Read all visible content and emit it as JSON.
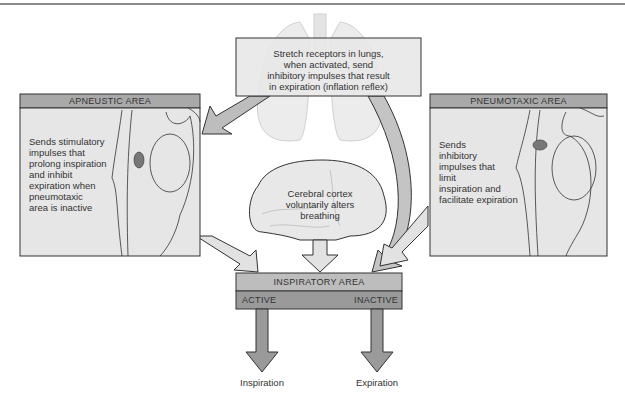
{
  "stretch_box": {
    "lines": [
      "Stretch receptors in lungs,",
      "when activated, send",
      "inhibitory impulses that result",
      "in expiration (inflation reflex)"
    ]
  },
  "apneustic": {
    "title": "APNEUSTIC AREA",
    "lines": [
      "Sends stimulatory",
      "impulses that",
      "prolong inspiration",
      "and inhibit",
      "expiration when",
      "pneumotaxic",
      "area is inactive"
    ]
  },
  "pneumotaxic": {
    "title": "PNEUMOTAXIC AREA",
    "lines": [
      "Sends",
      "inhibitory",
      "impulses that",
      "limit",
      "inspiration and",
      "facilitate expiration"
    ]
  },
  "cortex": {
    "lines": [
      "Cerebral cortex",
      "voluntarily alters",
      "breathing"
    ]
  },
  "inspiratory": {
    "title": "INSPIRATORY AREA",
    "active": "ACTIVE",
    "inactive": "INACTIVE"
  },
  "outputs": {
    "left": "Inspiration",
    "right": "Expiration"
  },
  "colors": {
    "header_gray": "#a9a9a9",
    "panel_gray": "#e6e6e6",
    "arrow_gray": "#bdbdbd",
    "dark_bar": "#9a9a9a"
  }
}
